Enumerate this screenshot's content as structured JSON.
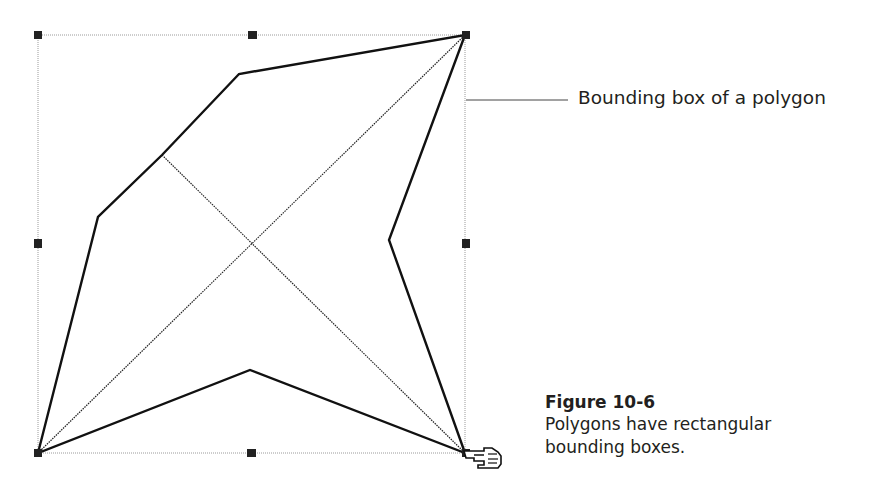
{
  "figure": {
    "callout_label": "Bounding box of a polygon",
    "caption_title": "Figure 10-6",
    "caption_line1": "Polygons have rectangular",
    "caption_line2": "bounding boxes."
  },
  "diagram": {
    "bounding_box": {
      "x": 38,
      "y": 35,
      "width": 427,
      "height": 418,
      "color": "#9a9a9a"
    },
    "handles": [
      {
        "x": 38,
        "y": 35
      },
      {
        "x": 252,
        "y": 35
      },
      {
        "x": 466,
        "y": 35
      },
      {
        "x": 38,
        "y": 243
      },
      {
        "x": 466,
        "y": 243
      },
      {
        "x": 38,
        "y": 453
      },
      {
        "x": 251,
        "y": 453
      },
      {
        "x": 466,
        "y": 453
      }
    ],
    "polygon_points": "38,453 98,217 162,155 239,74 465,35 389,240 465,453 250,370",
    "diagonals": [
      {
        "x1": 38,
        "y1": 453,
        "x2": 465,
        "y2": 35
      },
      {
        "x1": 162,
        "y1": 155,
        "x2": 465,
        "y2": 453
      }
    ],
    "callout_line": {
      "x1": 466,
      "y1": 100,
      "x2": 568,
      "y2": 100
    },
    "cursor": "pointing-hand"
  }
}
